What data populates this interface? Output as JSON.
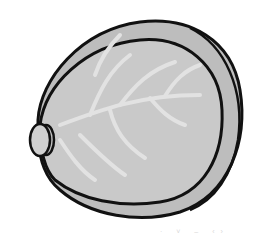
{
  "illustration": {
    "subject": "cabbage",
    "style": "grayscale clip art with black outlines",
    "colors": {
      "outline": "#111111",
      "outer_leaf": "#bdbdbd",
      "inner_head": "#c9c9c9",
      "veins": "#e2e2e2",
      "stem": "#d0d0d0",
      "background": "#ffffff"
    }
  },
  "watermark": {
    "text": "· ˅ ‒ ‹›"
  }
}
